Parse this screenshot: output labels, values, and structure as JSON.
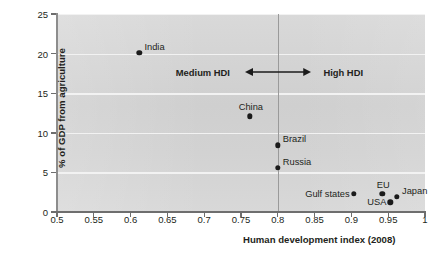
{
  "chart_data": {
    "type": "scatter",
    "title": "",
    "xlabel": "Human development index (2008)",
    "ylabel": "% of GDP from agriculture",
    "xlim": [
      0.5,
      1.0
    ],
    "ylim": [
      0,
      25
    ],
    "xticks": [
      "0.5",
      "0.55",
      "0.6",
      "0.65",
      "0.7",
      "0.75",
      "0.8",
      "0.85",
      "0.9",
      "0.95",
      "1"
    ],
    "xtick_values": [
      0.5,
      0.55,
      0.6,
      0.65,
      0.7,
      0.75,
      0.8,
      0.85,
      0.9,
      0.95,
      1.0
    ],
    "yticks": [
      "0",
      "5",
      "10",
      "15",
      "20",
      "25"
    ],
    "ytick_values": [
      0,
      5,
      10,
      15,
      20,
      25
    ],
    "grid": true,
    "grid_axis": "y",
    "legend": "none",
    "points": [
      {
        "name": "India",
        "x": 0.612,
        "y": 20.1,
        "label": "India",
        "label_pos": "right"
      },
      {
        "name": "China",
        "x": 0.762,
        "y": 12.1,
        "label": "China",
        "label_pos": "above"
      },
      {
        "name": "Brazil",
        "x": 0.8,
        "y": 8.4,
        "label": "Brazil",
        "label_pos": "right"
      },
      {
        "name": "Russia",
        "x": 0.8,
        "y": 5.6,
        "label": "Russia",
        "label_pos": "right"
      },
      {
        "name": "Gulf states",
        "x": 0.903,
        "y": 2.3,
        "label": "Gulf states",
        "label_pos": "left"
      },
      {
        "name": "EU",
        "x": 0.942,
        "y": 2.3,
        "label": "EU",
        "label_pos": "above"
      },
      {
        "name": "USA",
        "x": 0.953,
        "y": 1.2,
        "label": "USA",
        "label_pos": "left"
      },
      {
        "name": "Japan",
        "x": 0.962,
        "y": 1.9,
        "label": "Japan",
        "label_pos": "right"
      }
    ],
    "annotations": [
      {
        "name": "hdi-threshold-line",
        "type": "vline",
        "x": 0.8
      },
      {
        "name": "medium-hdi-label",
        "type": "text",
        "text": "Medium HDI",
        "x": 0.735,
        "y": 17.7
      },
      {
        "name": "high-hdi-label",
        "type": "text",
        "text": "High HDI",
        "x": 0.862,
        "y": 17.7
      },
      {
        "name": "hdi-double-arrow",
        "type": "arrow",
        "x1": 0.755,
        "x2": 0.845,
        "y": 17.7
      }
    ],
    "colors": {
      "point": "#1b1b1b",
      "plot_background": "#d4d4d4",
      "gridline": "#f2f2f2",
      "axis": "#6e6e6e",
      "divider": "#9a9a9a",
      "text": "#231f20"
    }
  }
}
